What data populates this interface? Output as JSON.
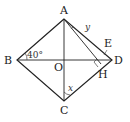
{
  "diagram": {
    "type": "geometry",
    "shape": "rhombus ABCD with diagonals AC and BD meeting at O",
    "points": {
      "A": {
        "label": "A",
        "x": 64,
        "y": 19
      },
      "B": {
        "label": "B",
        "x": 17,
        "y": 60
      },
      "C": {
        "label": "C",
        "x": 64,
        "y": 101
      },
      "D": {
        "label": "D",
        "x": 112,
        "y": 60
      },
      "O": {
        "label": "O",
        "x": 64,
        "y": 60
      },
      "E": {
        "label": "E",
        "x": 107,
        "y": 47
      },
      "H": {
        "label": "H",
        "x": 101,
        "y": 64
      }
    },
    "angle_label": "40°",
    "var_x": "x",
    "var_y": "y"
  }
}
